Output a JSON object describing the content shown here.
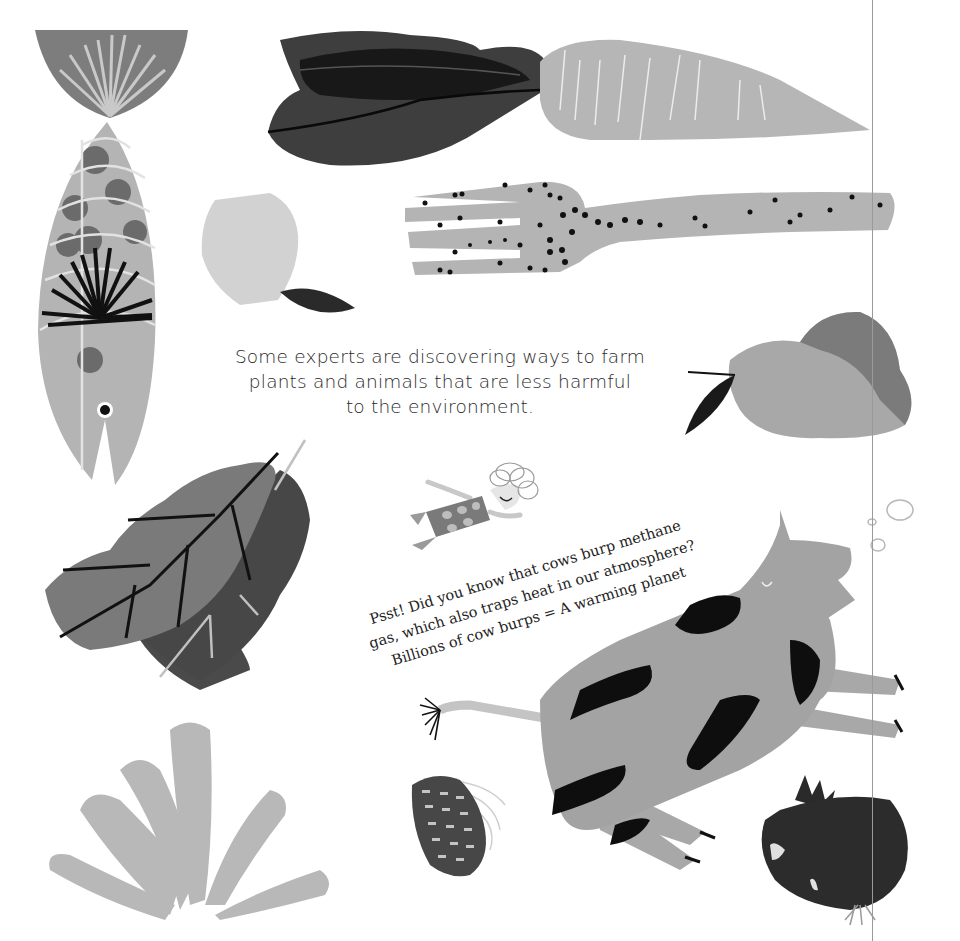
{
  "page": {
    "main_text": {
      "line1": "Some experts are discovering ways to farm",
      "line2": "plants and animals that are less harmful",
      "line3": "to the environment."
    },
    "psst_text": {
      "line1": "Psst! Did you know that cows burp methane",
      "line2": "gas, which also traps heat in our atmosphere?",
      "line3": "Billions of cow burps = A warming planet"
    },
    "illustrations": [
      "fish-icon",
      "carrot-icon",
      "fork-icon",
      "apple-icon",
      "pear-icon",
      "leaf-icon",
      "child-figure-icon",
      "cow-icon",
      "seaweed-icon",
      "blackberry-icon",
      "beet-icon",
      "burp-bubbles-icon"
    ],
    "colors": {
      "background": "#ffffff",
      "light_gray": "#b4b4b4",
      "mid_gray": "#8c8c8c",
      "dark_gray": "#555555",
      "black": "#111111"
    }
  }
}
